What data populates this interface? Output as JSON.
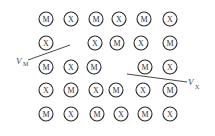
{
  "diagram": {
    "atom_radius": 7,
    "colors": {
      "stroke": "#2a2a2a",
      "text": "#333333",
      "background": "#ffffff"
    },
    "atoms": [
      {
        "label": "M",
        "x": 46,
        "y": 19
      },
      {
        "label": "X",
        "x": 71,
        "y": 19
      },
      {
        "label": "M",
        "x": 96,
        "y": 19
      },
      {
        "label": "X",
        "x": 119,
        "y": 19
      },
      {
        "label": "M",
        "x": 144,
        "y": 19
      },
      {
        "label": "X",
        "x": 170,
        "y": 19
      },
      {
        "label": "X",
        "x": 46,
        "y": 43
      },
      {
        "label": "X",
        "x": 95,
        "y": 43
      },
      {
        "label": "M",
        "x": 117,
        "y": 43
      },
      {
        "label": "X",
        "x": 141,
        "y": 43
      },
      {
        "label": "M",
        "x": 170,
        "y": 43
      },
      {
        "label": "M",
        "x": 46,
        "y": 67
      },
      {
        "label": "X",
        "x": 71,
        "y": 67
      },
      {
        "label": "M",
        "x": 94,
        "y": 67
      },
      {
        "label": "M",
        "x": 145,
        "y": 67
      },
      {
        "label": "X",
        "x": 170,
        "y": 67
      },
      {
        "label": "X",
        "x": 46,
        "y": 90
      },
      {
        "label": "M",
        "x": 71,
        "y": 90
      },
      {
        "label": "X",
        "x": 96,
        "y": 90
      },
      {
        "label": "M",
        "x": 116,
        "y": 90
      },
      {
        "label": "X",
        "x": 143,
        "y": 90
      },
      {
        "label": "M",
        "x": 170,
        "y": 90
      },
      {
        "label": "M",
        "x": 46,
        "y": 114
      },
      {
        "label": "X",
        "x": 71,
        "y": 114
      },
      {
        "label": "M",
        "x": 97,
        "y": 114
      },
      {
        "label": "X",
        "x": 121,
        "y": 114
      },
      {
        "label": "M",
        "x": 145,
        "y": 114
      },
      {
        "label": "X",
        "x": 170,
        "y": 114
      }
    ],
    "vacancies": [
      {
        "name": "metal-vacancy",
        "main": "V",
        "sub": "M",
        "label_x": 16,
        "label_y": 64,
        "sub_x": 23,
        "sub_y": 66,
        "line": {
          "x1": 28,
          "y1": 60,
          "x2": 70,
          "y2": 45
        }
      },
      {
        "name": "nonmetal-vacancy",
        "main": "V",
        "sub": "X",
        "label_x": 188,
        "label_y": 85,
        "sub_x": 195,
        "sub_y": 89,
        "line": {
          "x1": 127,
          "y1": 74,
          "x2": 187,
          "y2": 82
        }
      }
    ]
  }
}
